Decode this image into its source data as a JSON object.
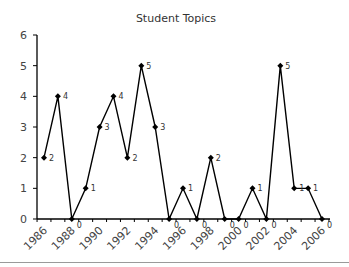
{
  "chart_data": {
    "type": "line",
    "title": "Student Topics",
    "xlabel": "",
    "ylabel": "",
    "x": [
      1986,
      1987,
      1988,
      1989,
      1990,
      1991,
      1992,
      1993,
      1994,
      1995,
      1996,
      1997,
      1998,
      1999,
      2000,
      2001,
      2002,
      2003,
      2004,
      2005,
      2006
    ],
    "series": [
      {
        "name": "Student Topics",
        "values": [
          2,
          4,
          0,
          1,
          3,
          4,
          2,
          5,
          3,
          0,
          1,
          0,
          2,
          0,
          0,
          1,
          0,
          5,
          1,
          1,
          0
        ]
      }
    ],
    "x_tick_labels": [
      "1986",
      "1988",
      "1990",
      "1992",
      "1994",
      "1996",
      "1998",
      "2000",
      "2002",
      "2004",
      "2006"
    ],
    "y_tick_labels": [
      "0",
      "1",
      "2",
      "3",
      "4",
      "5",
      "6"
    ],
    "ylim": [
      0,
      6
    ],
    "xlim": [
      1986,
      2006
    ],
    "grid": false,
    "legend": "none",
    "marker": "diamond",
    "data_labels": true,
    "colors": {
      "line": "#000000",
      "axis": "#000000",
      "text": "#333333"
    }
  }
}
